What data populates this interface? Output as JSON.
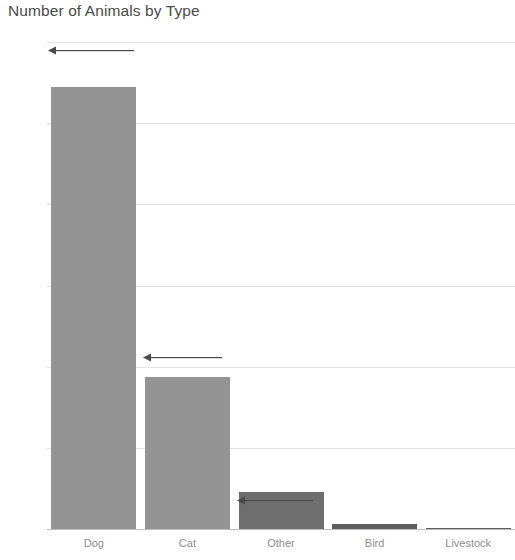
{
  "chart_data": {
    "type": "bar",
    "title": "Number of Animals by Type",
    "xlabel": "",
    "ylabel": "",
    "categories": [
      "Dog",
      "Cat",
      "Other",
      "Bird",
      "Livestock"
    ],
    "values": [
      5450,
      1870,
      456,
      62,
      5
    ],
    "ylim": [
      0,
      6000
    ],
    "yticks": [
      0,
      1000,
      2000,
      3000,
      4000,
      5000,
      6000
    ],
    "ytick_labels": [
      "0",
      "1,000",
      "2,000",
      "3,000",
      "4,000",
      "5,000",
      "6,000"
    ],
    "grid": true,
    "legend": "none",
    "bar_colors": [
      "#949494",
      "#949494",
      "#6e6e6e",
      "#5d5d5d",
      "#5d5d5d"
    ],
    "annotations": [
      {
        "name": "arrow-above-dog-bar",
        "value_marker": 5900
      },
      {
        "name": "arrow-above-cat-bar",
        "value_marker": 2120
      },
      {
        "name": "arrow-inside-other-bar",
        "value_marker": 360
      }
    ]
  },
  "colors": {
    "title_text": "#4a4a4a",
    "tick_text": "#8a8a8a",
    "gridline": "#e2e2e2",
    "axis_line": "#bdbdbd",
    "bar_default": "#949494",
    "bar_highlight": "#6e6e6e",
    "annotation": "#4a4a4a",
    "background": "#ffffff"
  }
}
